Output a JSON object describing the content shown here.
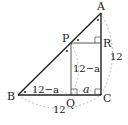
{
  "diagram": {
    "points": {
      "A": {
        "label": "A",
        "x": 101,
        "y": 13
      },
      "B": {
        "label": "B",
        "x": 18,
        "y": 95
      },
      "C": {
        "label": "C",
        "x": 101,
        "y": 95
      },
      "P": {
        "label": "P",
        "x": 71,
        "y": 43
      },
      "Q": {
        "label": "Q",
        "x": 71,
        "y": 95
      },
      "R": {
        "label": "R",
        "x": 101,
        "y": 43
      }
    },
    "labels": {
      "A": "A",
      "B": "B",
      "C": "C",
      "P": "P",
      "Q": "Q",
      "R": "R",
      "PQ_length": "12−a",
      "BQ_length": "12−a",
      "QC_length": "a",
      "AC_length": "12",
      "BC_length": "12"
    },
    "colors": {
      "line": "#222222",
      "dashed": "#aaaaaa"
    }
  }
}
